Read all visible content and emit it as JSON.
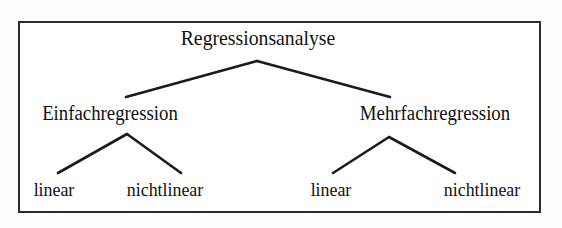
{
  "diagram": {
    "type": "hierarchy-tree",
    "title": "Regressionsanalyse",
    "levels": 3,
    "colors": {
      "ink": "#111111",
      "frame": "#2b2b2b",
      "background": "#ffffff"
    },
    "root": {
      "label": "Regressionsanalyse"
    },
    "branches": [
      {
        "label": "Einfachregression",
        "leaves": [
          {
            "label": "linear"
          },
          {
            "label": "nichtlinear"
          }
        ]
      },
      {
        "label": "Mehrfachregression",
        "leaves": [
          {
            "label": "linear"
          },
          {
            "label": "nichtlinear"
          }
        ]
      }
    ]
  }
}
